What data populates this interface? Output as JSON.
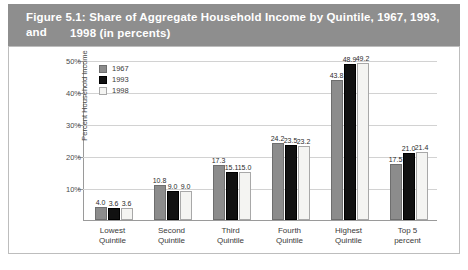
{
  "figure": {
    "title_line1": "Figure 5.1: Share of Aggregate Household Income by Quintile, 1967, 1993, and",
    "title_line2": "1998 (in percents)",
    "title_bar_color": "#8e8e8e"
  },
  "chart_data": {
    "type": "bar",
    "title": "Share of Aggregate Household Income by Quintile, 1967, 1993, and 1998 (in percents)",
    "xlabel": "",
    "ylabel": "Percent Household Income",
    "ylim": [
      0,
      50
    ],
    "yticks": [
      10,
      20,
      30,
      40,
      50
    ],
    "ytick_labels": [
      "10%",
      "20%",
      "30%",
      "40%",
      "50%"
    ],
    "grid": true,
    "legend_position": "top-left inside plot",
    "categories": [
      "Lowest Quintile",
      "Second Quintile",
      "Third Quintile",
      "Fourth Quintile",
      "Highest Quintile",
      "Top 5 percent"
    ],
    "category_lines": [
      [
        "Lowest",
        "Quintile"
      ],
      [
        "Second",
        "Quintile"
      ],
      [
        "Third",
        "Quintile"
      ],
      [
        "Fourth",
        "Quintile"
      ],
      [
        "Highest",
        "Quintile"
      ],
      [
        "Top 5",
        "percent"
      ]
    ],
    "series": [
      {
        "name": "1967",
        "color": "#8c8c8c",
        "border": "#6e6e6e",
        "values": [
          4.0,
          10.8,
          17.3,
          24.2,
          43.8,
          17.5
        ],
        "labels": [
          "4.0",
          "10.8",
          "17.3",
          "24.2",
          "43.8",
          "17.5"
        ]
      },
      {
        "name": "1993",
        "color": "#111111",
        "border": "#000000",
        "values": [
          3.6,
          9.0,
          15.1,
          23.5,
          48.9,
          21.0
        ],
        "labels": [
          "3.6",
          "9.0",
          "15.1",
          "23.5",
          "48.9",
          "21.0"
        ]
      },
      {
        "name": "1998",
        "color": "#f4f4f2",
        "border": "#a8a8a8",
        "values": [
          3.6,
          9.0,
          15.0,
          23.2,
          49.2,
          21.4
        ],
        "labels": [
          "3.6",
          "9.0",
          "15.0",
          "23.2",
          "49.2",
          "21.4"
        ]
      }
    ]
  }
}
